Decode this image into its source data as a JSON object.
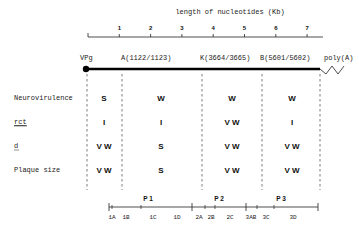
{
  "title": "length of nucleotides (Kb)",
  "top_axis": {
    "ticks": [
      "1",
      "2",
      "3",
      "4",
      "5",
      "6",
      "7"
    ],
    "range_kb": [
      0,
      7.5
    ]
  },
  "genome": {
    "five_prime_label": "VPg",
    "three_prime_label": "poly(A)",
    "markers": [
      {
        "label": "A(1122/1123)"
      },
      {
        "label": "K(3664/3665)"
      },
      {
        "label": "B(5601/5602)"
      }
    ]
  },
  "rows": [
    {
      "label": "Neurovirulence",
      "underline": false,
      "values": [
        "S",
        "W",
        "W",
        "W"
      ]
    },
    {
      "label": "rct",
      "underline": true,
      "values": [
        "I",
        "I",
        "V W",
        "I"
      ]
    },
    {
      "label": "d",
      "underline": true,
      "values": [
        "V W",
        "S",
        "V W",
        "V W"
      ]
    },
    {
      "label": "Plaque size",
      "underline": false,
      "values": [
        "V W",
        "S",
        "V W",
        "V W"
      ]
    }
  ],
  "proteins": {
    "regions": [
      "P 1",
      "P 2",
      "P 3"
    ],
    "segments": [
      "1A",
      "1B",
      "1C",
      "1D",
      "2A",
      "2B",
      "2C",
      "3AB",
      "3C",
      "3D"
    ]
  }
}
